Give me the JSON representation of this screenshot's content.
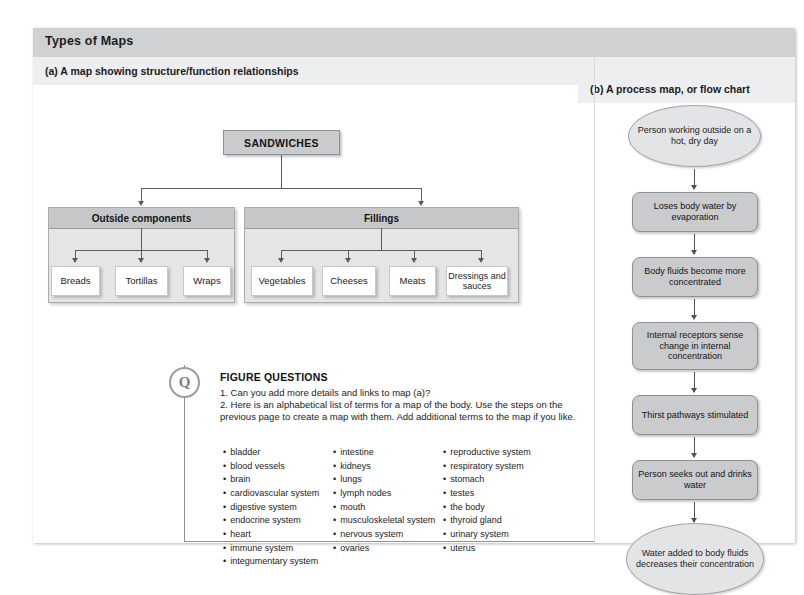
{
  "figure": {
    "title": "Types of Maps",
    "panel_a_label": "(a) A map showing structure/function relationships",
    "panel_b_label": "(b) A process map, or flow chart"
  },
  "concept_map": {
    "root": "SANDWICHES",
    "groups": [
      {
        "title": "Outside components",
        "items": [
          "Breads",
          "Tortillas",
          "Wraps"
        ]
      },
      {
        "title": "Fillings",
        "items": [
          "Vegetables",
          "Cheeses",
          "Meats",
          "Dressings and sauces"
        ]
      }
    ]
  },
  "flow_chart": {
    "steps": [
      {
        "text": "Person working outside on a hot, dry day",
        "shape": "oval"
      },
      {
        "text": "Loses body water by evaporation",
        "shape": "box"
      },
      {
        "text": "Body fluids become more concentrated",
        "shape": "box"
      },
      {
        "text": "Internal receptors sense change in internal concentration",
        "shape": "box"
      },
      {
        "text": "Thirst pathways stimulated",
        "shape": "box"
      },
      {
        "text": "Person seeks out and drinks water",
        "shape": "box"
      },
      {
        "text": "Water added to body fluids decreases their concentration",
        "shape": "oval"
      }
    ]
  },
  "figure_questions": {
    "badge": "Q",
    "title": "FIGURE QUESTIONS",
    "q1": "1. Can you add more details and links to map (a)?",
    "q2": "2. Here is an alphabetical list of terms for a map of the body. Use the steps on the previous page to create a map with them. Add additional terms to the map if you like.",
    "terms_col1": [
      "bladder",
      "blood vessels",
      "brain",
      "cardiovascular system",
      "digestive system",
      "endocrine system",
      "heart",
      "immune system",
      "integumentary system"
    ],
    "terms_col2": [
      "intestine",
      "kidneys",
      "lungs",
      "lymph nodes",
      "mouth",
      "musculoskeletal system",
      "nervous system",
      "ovaries"
    ],
    "terms_col3": [
      "reproductive system",
      "respiratory system",
      "stomach",
      "testes",
      "the body",
      "thyroid gland",
      "urinary system",
      "uterus"
    ]
  },
  "colors": {
    "title_bar": "#cfd1d3",
    "band": "#eceeef",
    "node_fill": "#c9cbcd",
    "group_fill": "#e4e5e6",
    "oval_fill": "#e3e4e5",
    "connector": "#5b5e61"
  }
}
